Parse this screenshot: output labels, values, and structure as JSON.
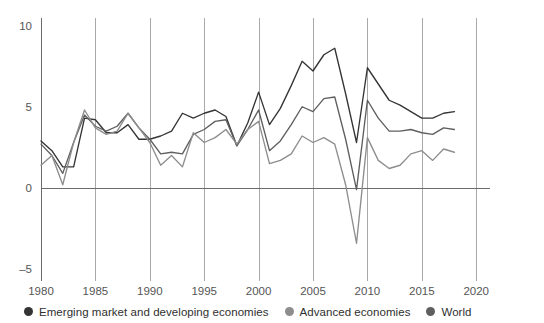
{
  "legend": {
    "position": "bottom-left",
    "items": [
      {
        "label": "Emerging market and developing economies",
        "color": "#343434",
        "icon": "legend-dot-icon"
      },
      {
        "label": "Advanced economies",
        "color": "#8d8d8d",
        "icon": "legend-dot-icon"
      },
      {
        "label": "World",
        "color": "#5f5f5f",
        "icon": "legend-dot-icon"
      }
    ]
  },
  "axes": {
    "y_ticks": [
      "10",
      "5",
      "0",
      "-5"
    ],
    "x_ticks": [
      "1980",
      "1985",
      "1990",
      "1995",
      "2000",
      "2005",
      "2010",
      "2015",
      "2020"
    ]
  },
  "chart_data": {
    "type": "line",
    "title": "",
    "subtitle": "",
    "xlabel": "",
    "ylabel": "",
    "xlim": [
      1980,
      2020
    ],
    "ylim": [
      -5,
      10
    ],
    "y_ticks": [
      10,
      5,
      0,
      -5
    ],
    "x_ticks": [
      1980,
      1985,
      1990,
      1995,
      2000,
      2005,
      2010,
      2015,
      2020
    ],
    "grid": "vertical-at-x-ticks",
    "zero_line": true,
    "legend_position": "bottom-left",
    "x": [
      1980,
      1981,
      1982,
      1983,
      1984,
      1985,
      1986,
      1987,
      1988,
      1989,
      1990,
      1991,
      1992,
      1993,
      1994,
      1995,
      1996,
      1997,
      1998,
      1999,
      2000,
      2001,
      2002,
      2003,
      2004,
      2005,
      2006,
      2007,
      2008,
      2009,
      2010,
      2011,
      2012,
      2013,
      2014,
      2015,
      2016,
      2017,
      2018
    ],
    "series": [
      {
        "name": "Emerging market and developing economies",
        "color": "#343434",
        "values": [
          2.9,
          2.3,
          1.3,
          1.3,
          4.3,
          4.2,
          3.4,
          3.4,
          3.9,
          3.0,
          3.0,
          3.2,
          3.5,
          4.6,
          4.3,
          4.6,
          4.8,
          4.4,
          2.6,
          4.0,
          5.9,
          3.9,
          4.9,
          6.3,
          7.8,
          7.2,
          8.2,
          8.6,
          5.8,
          2.8,
          7.4,
          6.4,
          5.4,
          5.1,
          4.7,
          4.3,
          4.3,
          4.6,
          4.7
        ]
      },
      {
        "name": "World",
        "color": "#5f5f5f",
        "values": [
          2.7,
          2.0,
          0.9,
          2.8,
          4.5,
          3.8,
          3.5,
          3.8,
          4.6,
          3.7,
          3.0,
          2.1,
          2.2,
          2.1,
          3.3,
          3.6,
          4.1,
          4.2,
          2.6,
          3.6,
          4.8,
          2.3,
          2.9,
          3.9,
          5.0,
          4.7,
          5.5,
          5.6,
          3.0,
          -0.1,
          5.4,
          4.3,
          3.5,
          3.5,
          3.6,
          3.4,
          3.3,
          3.7,
          3.6
        ]
      },
      {
        "name": "Advanced economies",
        "color": "#8d8d8d",
        "values": [
          1.4,
          2.0,
          0.2,
          2.8,
          4.8,
          3.7,
          3.3,
          3.5,
          4.6,
          3.7,
          2.8,
          1.4,
          2.0,
          1.3,
          3.4,
          2.8,
          3.1,
          3.6,
          2.7,
          3.6,
          4.1,
          1.5,
          1.7,
          2.1,
          3.2,
          2.8,
          3.1,
          2.7,
          0.2,
          -3.4,
          3.1,
          1.7,
          1.2,
          1.4,
          2.1,
          2.3,
          1.7,
          2.4,
          2.2
        ]
      }
    ]
  }
}
